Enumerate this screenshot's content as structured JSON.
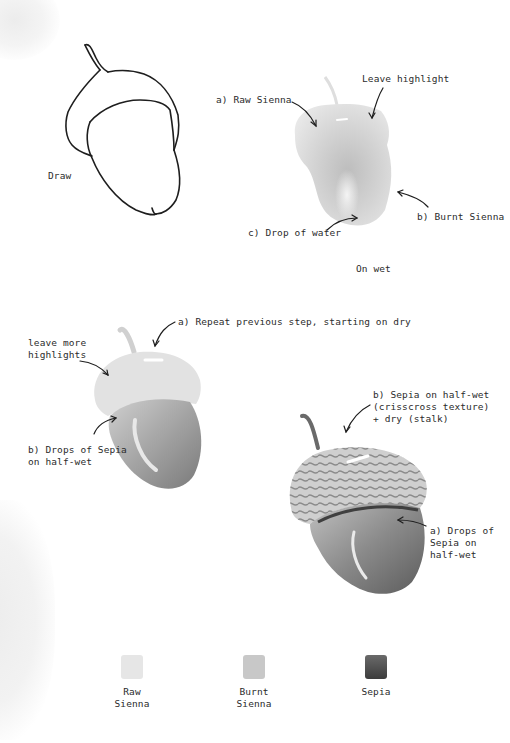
{
  "page": {
    "type": "watercolor-tutorial-acorn"
  },
  "steps": {
    "step1": {
      "label": "Draw"
    },
    "step2": {
      "annotations": {
        "raw_sienna": "a) Raw Sienna",
        "highlight": "Leave highlight",
        "burnt_sienna": "b) Burnt Sienna",
        "water": "c) Drop of water"
      },
      "caption": "On wet"
    },
    "step3": {
      "annotations": {
        "repeat": "a) Repeat previous step, starting on dry",
        "more_highlights": "leave more\nhighlights",
        "sepia_drops": "b) Drops of Sepia\non half-wet"
      }
    },
    "step4": {
      "annotations": {
        "sepia_texture": "b) Sepia on half-wet\n(crisscross texture)\n+ dry (stalk)",
        "sepia_drops": "a) Drops of\nSepia on\nhalf-wet"
      }
    }
  },
  "palette": {
    "swatches": [
      {
        "name": "Raw\nSienna",
        "color": "#e6e6e6"
      },
      {
        "name": "Burnt\nSienna",
        "color": "#c8c8c8"
      },
      {
        "name": "Sepia",
        "color": "#5a5a5a"
      }
    ]
  }
}
